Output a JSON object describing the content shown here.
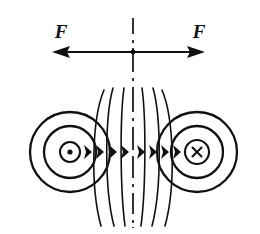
{
  "figure": {
    "background_color": "#ffffff",
    "line_color": "#111111",
    "width": 260,
    "height": 234
  },
  "labels": {
    "force_left": "F",
    "force_right": "F"
  },
  "conductors": [
    {
      "id": "left-conductor",
      "current_direction": "out-of-page",
      "symbol": "dot",
      "center_x": 70,
      "center_y": 152,
      "radii": [
        10,
        26,
        40
      ]
    },
    {
      "id": "right-conductor",
      "current_direction": "into-page",
      "symbol": "cross",
      "center_x": 197,
      "center_y": 152,
      "radii": [
        12,
        26,
        40
      ]
    }
  ],
  "centerline": {
    "style": "dash-dot",
    "x": 133,
    "y_top": 18,
    "y_bottom": 228
  },
  "force_arrows": {
    "y": 52,
    "left_tip_x": 52,
    "right_tip_x": 205,
    "direction_left": "left",
    "direction_right": "right"
  },
  "field_lines": {
    "count": 6,
    "arrow_count": 8,
    "arrow_direction": "right",
    "arrow_y": 152,
    "top_y": 88,
    "bottom_y": 226
  },
  "icon_names": {
    "current_out_icon": "dot-icon",
    "current_in_icon": "cross-icon",
    "arrow_left_icon": "arrow-left-icon",
    "arrow_right_icon": "arrow-right-icon"
  }
}
